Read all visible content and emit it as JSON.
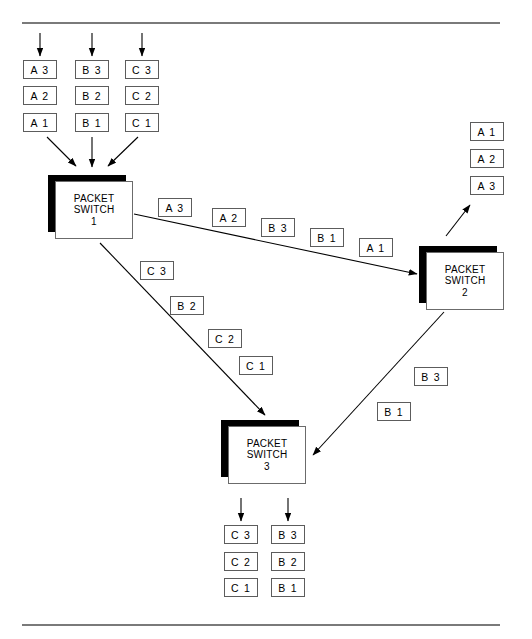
{
  "figure": {
    "top_rule": true,
    "bottom_rule": true,
    "line_color": "#000000",
    "box_border_color": "#5c5c5c",
    "shadow_color": "#000000"
  },
  "switches": [
    {
      "name": "switch-1",
      "line1": "PACKET",
      "line2": "SWITCH",
      "line3": "1",
      "x": 48,
      "y": 175
    },
    {
      "name": "switch-2",
      "line1": "PACKET",
      "line2": "SWITCH",
      "line3": "2",
      "x": 419,
      "y": 246
    },
    {
      "name": "switch-3",
      "line1": "PACKET",
      "line2": "SWITCH",
      "line3": "3",
      "x": 221,
      "y": 420
    }
  ],
  "input_queues": [
    {
      "column": "A",
      "x": 23,
      "cells": [
        {
          "label": "A 3",
          "y": 60
        },
        {
          "label": "A 2",
          "y": 86
        },
        {
          "label": "A 1",
          "y": 113
        }
      ]
    },
    {
      "column": "B",
      "x": 75,
      "cells": [
        {
          "label": "B 3",
          "y": 60
        },
        {
          "label": "B 2",
          "y": 86
        },
        {
          "label": "B 1",
          "y": 113
        }
      ]
    },
    {
      "column": "C",
      "x": 125,
      "cells": [
        {
          "label": "C 3",
          "y": 60
        },
        {
          "label": "C 2",
          "y": 86
        },
        {
          "label": "C 1",
          "y": 113
        }
      ]
    }
  ],
  "output_queues_switch2": [
    {
      "label": "A 1",
      "x": 470,
      "y": 122
    },
    {
      "label": "A 2",
      "x": 470,
      "y": 149
    },
    {
      "label": "A 3",
      "x": 470,
      "y": 176
    }
  ],
  "output_queues_switch3": [
    {
      "column": "C",
      "x": 224,
      "cells": [
        {
          "label": "C 3",
          "y": 525
        },
        {
          "label": "C 2",
          "y": 552
        },
        {
          "label": "C 1",
          "y": 578
        }
      ]
    },
    {
      "column": "B",
      "x": 271,
      "cells": [
        {
          "label": "B 3",
          "y": 525
        },
        {
          "label": "B 2",
          "y": 552
        },
        {
          "label": "B 1",
          "y": 578
        }
      ]
    }
  ],
  "transit_s1_s2": [
    {
      "label": "A 3",
      "x": 158,
      "y": 198
    },
    {
      "label": "A 2",
      "x": 212,
      "y": 208
    },
    {
      "label": "B 3",
      "x": 261,
      "y": 218
    },
    {
      "label": "B 1",
      "x": 310,
      "y": 228
    },
    {
      "label": "A 1",
      "x": 359,
      "y": 238
    }
  ],
  "transit_s1_s3": [
    {
      "label": "C 3",
      "x": 140,
      "y": 261
    },
    {
      "label": "B 2",
      "x": 170,
      "y": 296
    },
    {
      "label": "C 2",
      "x": 208,
      "y": 329
    },
    {
      "label": "C 1",
      "x": 239,
      "y": 356
    }
  ],
  "transit_s2_s3": [
    {
      "label": "B 3",
      "x": 414,
      "y": 367
    },
    {
      "label": "B 1",
      "x": 377,
      "y": 402
    }
  ],
  "arrows": {
    "inbound_top": [
      {
        "name": "inbound-arrow-a",
        "x1": 40,
        "y1": 33,
        "x2": 40,
        "y2": 56
      },
      {
        "name": "inbound-arrow-b",
        "x1": 92,
        "y1": 33,
        "x2": 92,
        "y2": 56
      },
      {
        "name": "inbound-arrow-c",
        "x1": 142,
        "y1": 33,
        "x2": 142,
        "y2": 56
      }
    ],
    "to_switch1": [
      {
        "name": "queue-a-to-switch1",
        "x1": 47,
        "y1": 137,
        "x2": 77,
        "y2": 167
      },
      {
        "name": "queue-b-to-switch1",
        "x1": 92,
        "y1": 137,
        "x2": 92,
        "y2": 167
      },
      {
        "name": "queue-c-to-switch1",
        "x1": 137,
        "y1": 137,
        "x2": 107,
        "y2": 167
      }
    ],
    "switch1_to_switch2": {
      "name": "switch1-to-switch2-link",
      "x1": 134,
      "y1": 215,
      "x2": 418,
      "y2": 274
    },
    "switch1_to_switch3": {
      "name": "switch1-to-switch3-link",
      "x1": 100,
      "y1": 243,
      "x2": 266,
      "y2": 416
    },
    "switch2_to_switch3": {
      "name": "switch2-to-switch3-link",
      "x1": 443,
      "y1": 313,
      "x2": 312,
      "y2": 456
    },
    "switch2_to_outqueue": {
      "name": "switch2-to-output-queue",
      "x1": 447,
      "y1": 235,
      "x2": 470,
      "y2": 204
    },
    "switch3_to_outqueue": [
      {
        "name": "switch3-to-output-queue-c",
        "x1": 241,
        "y1": 498,
        "x2": 241,
        "y2": 521
      },
      {
        "name": "switch3-to-output-queue-b",
        "x1": 288,
        "y1": 498,
        "x2": 288,
        "y2": 521
      }
    ]
  }
}
